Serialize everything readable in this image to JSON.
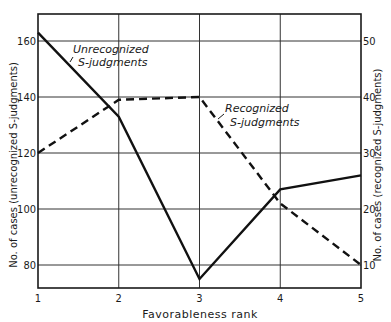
{
  "chart_data": {
    "type": "line",
    "title": "",
    "xlabel": "Favorableness rank",
    "ylabel": "No. of cases (unrecognized S-judgments)",
    "ylabel_right": "No. of cases (recognized S-judgments)",
    "x": [
      1,
      2,
      3,
      4,
      5
    ],
    "categories": [
      "1",
      "2",
      "3",
      "4",
      "5"
    ],
    "ylim": [
      72,
      168
    ],
    "ylim_right": [
      6.5,
      54
    ],
    "yticks_left": [
      80,
      100,
      120,
      140,
      160
    ],
    "yticks_right": [
      10,
      20,
      30,
      40,
      50
    ],
    "grid": true,
    "legend": "none (inline annotations)",
    "series": [
      {
        "name": "Unrecognized S-judgments",
        "axis": "left",
        "style": "solid",
        "values": [
          163,
          133,
          75,
          107,
          112
        ]
      },
      {
        "name": "Recognized S-judgments",
        "axis": "right",
        "style": "dashed",
        "values": [
          30,
          39.5,
          40,
          21,
          10
        ]
      }
    ],
    "annotations": [
      {
        "text": [
          "Unrecognized",
          "S-judgments"
        ],
        "series": "Unrecognized S-judgments"
      },
      {
        "text": [
          "Recognized",
          "S-judgments"
        ],
        "series": "Recognized S-judgments"
      }
    ]
  },
  "labels": {
    "xlabel": "Favorableness rank",
    "ylabel_left": "No. of cases (unrecognized S-judgments)",
    "ylabel_right": "No. of cases (recognized S-judgments)",
    "ann_unrec_1": "Unrecognized",
    "ann_unrec_2": "S-judgments",
    "ann_rec_1": "Recognized",
    "ann_rec_2": "S-judgments"
  }
}
